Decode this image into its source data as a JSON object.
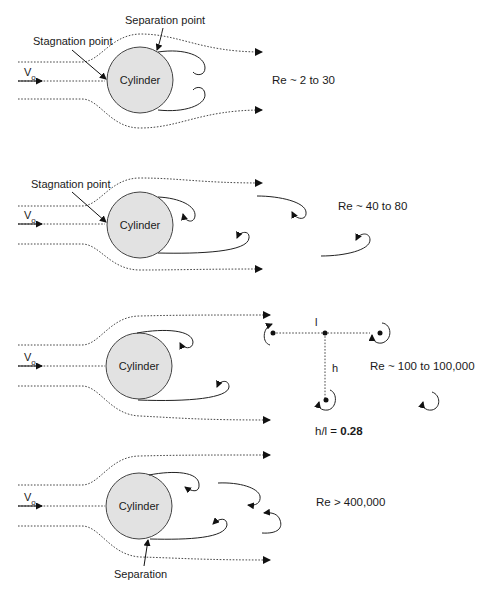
{
  "panels": [
    {
      "cylinder_label": "Cylinder",
      "velocity_label": "V",
      "velocity_subscript": "o",
      "annotations": [
        "Separation point",
        "Stagnation point"
      ],
      "reynolds": "Re ~ 2 to 30"
    },
    {
      "cylinder_label": "Cylinder",
      "velocity_label": "V",
      "velocity_subscript": "o",
      "annotations": [
        "Stagnation point"
      ],
      "reynolds": "Re ~ 40 to 80"
    },
    {
      "cylinder_label": "Cylinder",
      "velocity_label": "V",
      "velocity_subscript": "o",
      "spacing_label_l": "l",
      "spacing_label_h": "h",
      "ratio_prefix": "h/l = ",
      "ratio_value": "0.28",
      "reynolds": "Re ~ 100 to 100,000"
    },
    {
      "cylinder_label": "Cylinder",
      "velocity_label": "V",
      "velocity_subscript": "o",
      "annotations": [
        "Separation"
      ],
      "reynolds": "Re > 400,000"
    }
  ],
  "colors": {
    "cylinder_fill": "#e2e2e2",
    "line": "#222222"
  }
}
